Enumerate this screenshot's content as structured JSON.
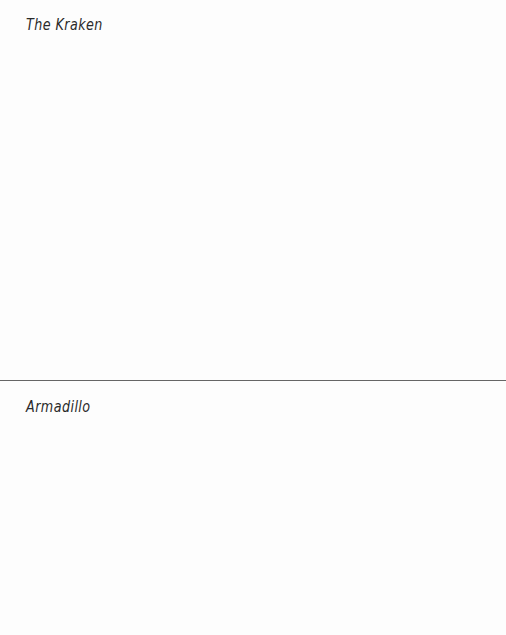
{
  "sections": [
    {
      "title": "The Kraken"
    },
    {
      "title": "Armadillo"
    }
  ]
}
